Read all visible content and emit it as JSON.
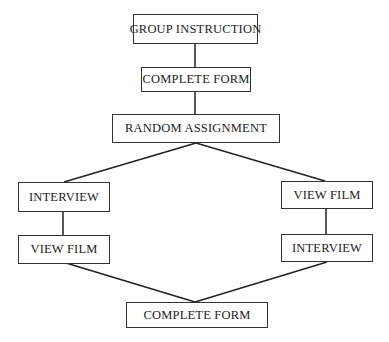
{
  "diagram": {
    "type": "flowchart",
    "nodes": [
      {
        "id": "group_instruction",
        "label": "GROUP INSTRUCTION"
      },
      {
        "id": "complete_form_1",
        "label": "COMPLETE FORM"
      },
      {
        "id": "random_assignment",
        "label": "RANDOM ASSIGNMENT"
      },
      {
        "id": "left_interview",
        "label": "INTERVIEW"
      },
      {
        "id": "left_view_film",
        "label": "VIEW FILM"
      },
      {
        "id": "right_view_film",
        "label": "VIEW FILM"
      },
      {
        "id": "right_interview",
        "label": "INTERVIEW"
      },
      {
        "id": "complete_form_2",
        "label": "COMPLETE FORM"
      }
    ],
    "edges": [
      [
        "group_instruction",
        "complete_form_1"
      ],
      [
        "complete_form_1",
        "random_assignment"
      ],
      [
        "random_assignment",
        "left_interview"
      ],
      [
        "random_assignment",
        "right_view_film"
      ],
      [
        "left_interview",
        "left_view_film"
      ],
      [
        "right_view_film",
        "right_interview"
      ],
      [
        "left_view_film",
        "complete_form_2"
      ],
      [
        "right_interview",
        "complete_form_2"
      ]
    ]
  }
}
